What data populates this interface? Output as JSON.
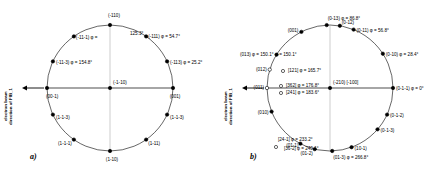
{
  "figure": {
    "width": 440,
    "height": 176,
    "background": "#ffffff",
    "stroke_color": "#000000",
    "marker_color": "#000000"
  },
  "chart_data": {
    "type": "scatter",
    "title": "",
    "subtitle": "",
    "xlabel": "",
    "ylabel": "",
    "grid": false,
    "legend": "none",
    "panels": [
      {
        "id": "a",
        "letter": "a)",
        "beam_caption_line1": "electron beam",
        "beam_caption_line2": "direction of FIB_1",
        "center": {
          "x": 110,
          "y": 88
        },
        "radius": 63,
        "center_pole": "(-1-10)",
        "points": [
          {
            "label": "(-110)",
            "phi": "",
            "angle_deg": 90,
            "anchor": "c",
            "dx": 4,
            "dy": -9
          },
          {
            "label": "(-111)",
            "phi": "φ = 54.7°",
            "angle_deg": 55,
            "anchor": "l",
            "dx": 2,
            "dy": 1
          },
          {
            "label": "(-113)",
            "phi": "φ = 25.2°",
            "angle_deg": 25,
            "anchor": "l",
            "dx": 3,
            "dy": 2
          },
          {
            "label": "(001)",
            "phi": "",
            "angle_deg": 0,
            "anchor": "c",
            "dx": 2,
            "dy": 9
          },
          {
            "label": "(1-1-3)",
            "phi": "",
            "angle_deg": -25,
            "anchor": "l",
            "dx": 3,
            "dy": 3
          },
          {
            "label": "(1-11)",
            "phi": "",
            "angle_deg": -55,
            "anchor": "l",
            "dx": 2,
            "dy": 4
          },
          {
            "label": "(1-10)",
            "phi": "",
            "angle_deg": -90,
            "anchor": "c",
            "dx": 2,
            "dy": 9
          },
          {
            "label": "(1-1-1)",
            "phi": "",
            "angle_deg": -125,
            "anchor": "r",
            "dx": -2,
            "dy": 4
          },
          {
            "label": "(1-1-3)",
            "phi": "",
            "angle_deg": -155,
            "anchor": "l",
            "dx": 3,
            "dy": 3
          },
          {
            "label": "(00-1)",
            "phi": "",
            "angle_deg": 180,
            "anchor": "l",
            "dx": -1,
            "dy": 9
          },
          {
            "label": "(-11-3)",
            "phi": "φ = 154.8°",
            "angle_deg": 155,
            "anchor": "l",
            "dx": 3,
            "dy": 2
          },
          {
            "label": "(-11-1)",
            "phi": "φ =",
            "angle_deg": 125,
            "anchor": "l",
            "dx": 2,
            "dy": 2
          }
        ],
        "extra_labels": [
          {
            "text": "125.3°",
            "x": 130,
            "y": 34,
            "anchor": "l"
          }
        ]
      },
      {
        "id": "b",
        "letter": "b)",
        "beam_caption_line1": "electron beam",
        "beam_caption_line2": "direction of FIB_1",
        "center": {
          "x": 110,
          "y": 88
        },
        "radius": 63,
        "center_pole": "(-210) [-100]",
        "points": [
          {
            "label": "(0-13)",
            "phi": "φ = 86.8°",
            "angle_deg": 93,
            "anchor": "l",
            "dx": 1,
            "dy": -6,
            "marker": "filled"
          },
          {
            "label": "(0-12)",
            "phi": "",
            "angle_deg": 81,
            "anchor": "l",
            "dx": 2,
            "dy": -3,
            "marker": "filled"
          },
          {
            "label": "(0-11)",
            "phi": "φ = 56.8°",
            "angle_deg": 68,
            "anchor": "l",
            "dx": 3,
            "dy": 1,
            "marker": "filled"
          },
          {
            "label": "(0-10)",
            "phi": "φ = 28.4°",
            "angle_deg": 33,
            "anchor": "l",
            "dx": 3,
            "dy": 1,
            "marker": "filled"
          },
          {
            "label": "(0-1-1)",
            "phi": "φ = 0°",
            "angle_deg": 0,
            "anchor": "l",
            "dx": 3,
            "dy": 1,
            "marker": "filled"
          },
          {
            "label": "(0-1-2)",
            "phi": "",
            "angle_deg": -25,
            "anchor": "l",
            "dx": 3,
            "dy": 1,
            "marker": "filled"
          },
          {
            "label": "(0-1-3)",
            "phi": "",
            "angle_deg": -41,
            "anchor": "l",
            "dx": 3,
            "dy": 2,
            "marker": "filled"
          },
          {
            "label": "(10-1)",
            "phi": "",
            "angle_deg": -70,
            "anchor": "l",
            "dx": 3,
            "dy": 2,
            "marker": "filled"
          },
          {
            "label": "(01-3)",
            "phi": "φ = 266.8°",
            "angle_deg": -88,
            "anchor": "l",
            "dx": 1,
            "dy": 7,
            "marker": "filled"
          },
          {
            "label": "(01-2)",
            "phi": "",
            "angle_deg": -104,
            "anchor": "r",
            "dx": -2,
            "dy": 5,
            "marker": "filled"
          },
          {
            "label": "(01-1)",
            "phi": "",
            "angle_deg": -118,
            "anchor": "r",
            "dx": -2,
            "dy": 2,
            "marker": "filled"
          },
          {
            "label": "(010)",
            "phi": "",
            "angle_deg": -158,
            "anchor": "r",
            "dx": -3,
            "dy": 1,
            "marker": "filled"
          },
          {
            "label": "(011)",
            "phi": "",
            "angle_deg": 180,
            "anchor": "r",
            "dx": -3,
            "dy": 0,
            "marker": "open"
          },
          {
            "label": "(012)",
            "phi": "",
            "angle_deg": 163,
            "anchor": "r",
            "dx": -3,
            "dy": 0,
            "marker": "open"
          },
          {
            "label": "(013)",
            "phi": "φ = 150.1°",
            "angle_deg": 148,
            "anchor": "r",
            "dx": -3,
            "dy": 0,
            "marker": "filled"
          },
          {
            "label": "(001)",
            "phi": "",
            "angle_deg": 117,
            "anchor": "r",
            "dx": -3,
            "dy": -1,
            "marker": "filled"
          }
        ],
        "extra_labels": [
          {
            "text": "[121] φ = 165.7°",
            "x": 68,
            "y": 71,
            "anchor": "l",
            "marker": "open",
            "mx": 63,
            "my": 71
          },
          {
            "text": "[362] φ = 176.8°",
            "x": 66,
            "y": 86,
            "anchor": "l",
            "marker": "open",
            "mx": 61,
            "my": 86
          },
          {
            "text": "[241] φ = 183.6°",
            "x": 66,
            "y": 93,
            "anchor": "l",
            "marker": "open",
            "mx": 61,
            "my": 93
          },
          {
            "text": "[24-1] φ = 233.2°",
            "x": 58,
            "y": 140,
            "anchor": "l",
            "marker": "open",
            "mx": 56,
            "my": 147
          },
          {
            "text": "[36-2] φ = 240.1°",
            "x": 64,
            "y": 149,
            "anchor": "l",
            "marker": "none",
            "mx": 0,
            "my": 0
          }
        ],
        "phi_150_label": {
          "text": "φ = 150.1°",
          "x": 55,
          "y": 55
        }
      }
    ]
  }
}
